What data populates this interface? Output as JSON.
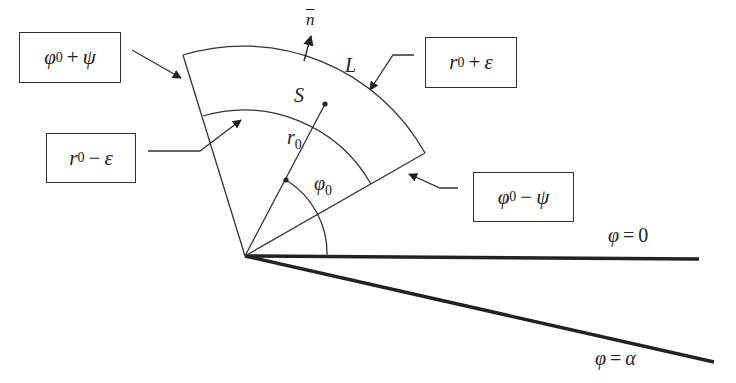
{
  "diagram": {
    "type": "annular-sector-geometry",
    "origin": {
      "x": 245,
      "y": 256
    },
    "sector": {
      "inner_radius_label": "r0 − ε",
      "outer_radius_label": "r0 + ε",
      "start_angle_label": "φ0 − ψ",
      "end_angle_label": "φ0 + ψ"
    },
    "labels": {
      "normal": {
        "base": "n",
        "decoration": "bar"
      },
      "boundary": "L",
      "region": "S",
      "radius": {
        "base": "r",
        "sub": "0"
      },
      "angle": {
        "base": "φ",
        "sub": "0"
      },
      "ray_zero": {
        "lhs": "φ",
        "op": "=",
        "rhs": "0"
      },
      "ray_alpha": {
        "lhs": "φ",
        "op": "=",
        "rhs": "α"
      }
    },
    "boxes": [
      {
        "id": "phi0-plus-psi",
        "base": "φ",
        "sub": "0",
        "op": "+",
        "rhs": "ψ"
      },
      {
        "id": "r0-minus-eps",
        "base": "r",
        "sub": "0",
        "op": "−",
        "rhs": "ε"
      },
      {
        "id": "r0-plus-eps",
        "base": "r",
        "sub": "0",
        "op": "+",
        "rhs": "ε"
      },
      {
        "id": "phi0-minus-psi",
        "base": "φ",
        "sub": "0",
        "op": "−",
        "rhs": "ψ"
      }
    ],
    "colors": {
      "stroke": "#333333",
      "bold_ray": "#222222",
      "text": "#222222",
      "background": "#ffffff"
    }
  }
}
